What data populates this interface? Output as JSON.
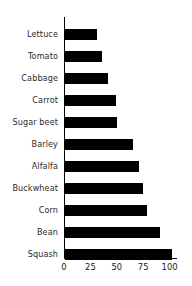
{
  "chart_data": {
    "type": "bar",
    "orientation": "horizontal",
    "title": "",
    "subtitle": "",
    "xlabel": "",
    "ylabel": "",
    "categories": [
      "Lettuce",
      "Tomato",
      "Cabbage",
      "Carrot",
      "Sugar beet",
      "Barley",
      "Alfalfa",
      "Buckwheat",
      "Corn",
      "Bean",
      "Squash"
    ],
    "values": [
      30,
      35,
      41,
      48,
      49,
      64,
      70,
      74,
      78,
      90,
      101
    ],
    "xlim": [
      0,
      107
    ],
    "xticks": [
      0,
      25,
      50,
      75,
      100
    ],
    "xtick_labels": [
      "0",
      "25",
      "50",
      "75",
      "100"
    ],
    "grid": false,
    "legend": null,
    "bar_color": "#000000",
    "background_color": "#ffffff",
    "axis_color": "#000000",
    "annotations": []
  }
}
